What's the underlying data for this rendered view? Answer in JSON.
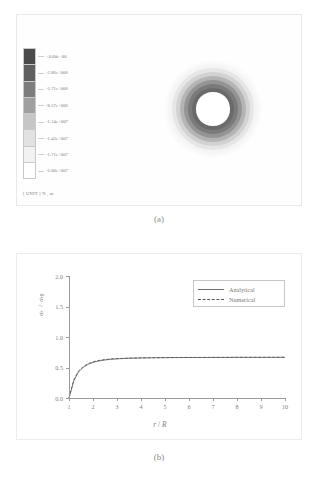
{
  "figure": {
    "panel_a": {
      "caption": "(a)",
      "colorbar": {
        "unit_text": "[ UNIT ] N , m",
        "labels": [
          "+0.00e+00",
          "-2.86e+006",
          "-5.71e+006",
          "-8.57e+006",
          "-1.14e+007",
          "-1.43e+007",
          "-1.71e+007",
          "-2.00e+007"
        ],
        "values": [
          0,
          -2860000,
          -5710000,
          -8570000,
          -11400000,
          -14300000,
          -17100000,
          -20000000
        ],
        "swatch_colors": [
          "#4a4a4a",
          "#606060",
          "#7d7d7d",
          "#a0a0a0",
          "#c6c6c6",
          "#e2e2e2",
          "#f2f2f2",
          "#ffffff"
        ]
      },
      "contour": {
        "name": "radial-stress-contour",
        "rings": [
          {
            "diameter_pct": 100,
            "color": "#f4f4f4"
          },
          {
            "diameter_pct": 90,
            "color": "#e6e6e6"
          },
          {
            "diameter_pct": 81,
            "color": "#d2d2d2"
          },
          {
            "diameter_pct": 72,
            "color": "#b4b4b4"
          },
          {
            "diameter_pct": 63,
            "color": "#949494"
          },
          {
            "diameter_pct": 54,
            "color": "#7a7a7a"
          },
          {
            "diameter_pct": 45,
            "color": "#6a6a6a"
          },
          {
            "diameter_pct": 36,
            "color": "#ffffff"
          }
        ]
      }
    },
    "panel_b": {
      "caption": "(b)"
    }
  },
  "chart_data": {
    "type": "line",
    "title": "",
    "xlabel": "r / R",
    "ylabel": "σr / σr0",
    "ylabel_parts": {
      "num": "σ",
      "num_sub": "r",
      "den": "σ",
      "den_sub": "r0"
    },
    "xlim": [
      1,
      10
    ],
    "ylim": [
      0,
      2.0
    ],
    "xticks": [
      1,
      2,
      3,
      4,
      5,
      6,
      7,
      8,
      9,
      10
    ],
    "xticklabels": [
      "1",
      "2",
      "3",
      "4",
      "5",
      "6",
      "7",
      "8",
      "9",
      "10"
    ],
    "yticks": [
      0.0,
      0.5,
      1.0,
      1.5,
      2.0
    ],
    "yticklabels": [
      "0.0",
      "0.5",
      "1.0",
      "1.5",
      "2.0"
    ],
    "grid": false,
    "legend_position": "upper right",
    "series": [
      {
        "name": "Analytical",
        "style": "solid",
        "color": "#6f6f6f",
        "x": [
          1.0,
          1.2,
          1.4,
          1.6,
          1.8,
          2.0,
          2.25,
          2.5,
          2.75,
          3.0,
          3.5,
          4.0,
          4.5,
          5.0,
          5.5,
          6.0,
          6.5,
          7.0,
          7.5,
          8.0,
          8.5,
          9.0,
          9.5,
          10.0
        ],
        "y": [
          0.0,
          0.281,
          0.43,
          0.504,
          0.552,
          0.584,
          0.608,
          0.624,
          0.635,
          0.642,
          0.651,
          0.656,
          0.659,
          0.661,
          0.663,
          0.664,
          0.664,
          0.665,
          0.665,
          0.666,
          0.666,
          0.666,
          0.666,
          0.667
        ]
      },
      {
        "name": "Numerical",
        "style": "dashed",
        "color": "#5a5a5a",
        "x": [
          1.0,
          1.2,
          1.4,
          1.6,
          1.8,
          2.0,
          2.25,
          2.5,
          2.75,
          3.0,
          3.5,
          4.0,
          4.5,
          5.0,
          5.5,
          6.0,
          6.5,
          7.0,
          7.5,
          8.0,
          8.5,
          9.0,
          9.5,
          10.0
        ],
        "y": [
          0.0,
          0.295,
          0.444,
          0.517,
          0.563,
          0.594,
          0.616,
          0.63,
          0.64,
          0.646,
          0.654,
          0.658,
          0.661,
          0.663,
          0.664,
          0.665,
          0.665,
          0.666,
          0.666,
          0.667,
          0.667,
          0.667,
          0.667,
          0.668
        ]
      }
    ],
    "legend": [
      "Analytical",
      "Numerical"
    ]
  }
}
